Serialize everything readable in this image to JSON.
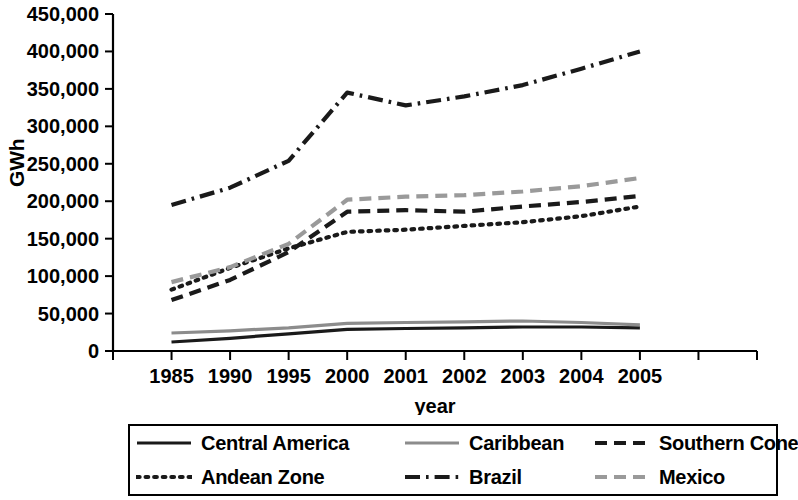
{
  "chart_data": {
    "type": "line",
    "title": "",
    "xlabel": "year",
    "ylabel": "GWh",
    "categories": [
      "1985",
      "1990",
      "1995",
      "2000",
      "2001",
      "2002",
      "2003",
      "2004",
      "2005"
    ],
    "ylim": [
      0,
      450000
    ],
    "ytick_labels": [
      "450,000",
      "400,000",
      "350,000",
      "300,000",
      "250,000",
      "200,000",
      "150,000",
      "100,000",
      "50,000",
      "0"
    ],
    "ytick_values": [
      450000,
      400000,
      350000,
      300000,
      250000,
      200000,
      150000,
      100000,
      50000,
      0
    ],
    "grid": false,
    "legend_position": "bottom",
    "series": [
      {
        "name": "Central America",
        "style": "solid",
        "color": "#1a1a1a",
        "values": [
          12000,
          17000,
          23000,
          29000,
          30000,
          31000,
          32000,
          32000,
          31000
        ]
      },
      {
        "name": "Caribbean",
        "style": "solid",
        "color": "#8c8c8c",
        "values": [
          24000,
          27000,
          31000,
          37000,
          38000,
          39000,
          40000,
          38000,
          35000
        ]
      },
      {
        "name": "Southern Cone",
        "style": "dashed",
        "color": "#1a1a1a",
        "values": [
          68000,
          95000,
          132000,
          186000,
          188000,
          186000,
          193000,
          199000,
          207000
        ]
      },
      {
        "name": "Andean Zone",
        "style": "dotted",
        "color": "#1a1a1a",
        "values": [
          82000,
          111000,
          137000,
          159000,
          162000,
          167000,
          172000,
          180000,
          193000
        ]
      },
      {
        "name": "Brazil",
        "style": "dashdot",
        "color": "#1a1a1a",
        "values": [
          195000,
          218000,
          254000,
          345000,
          328000,
          340000,
          355000,
          377000,
          400000
        ]
      },
      {
        "name": "Mexico",
        "style": "dashed",
        "color": "#9a9a9a",
        "values": [
          92000,
          112000,
          143000,
          202000,
          206000,
          208000,
          213000,
          220000,
          231000
        ]
      }
    ]
  },
  "axis": {
    "y_title": "GWh",
    "x_title": "year"
  }
}
